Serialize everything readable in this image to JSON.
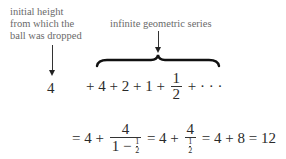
{
  "annotations": {
    "initial_height_label": [
      "initial height",
      "from which the",
      "ball was dropped"
    ],
    "series_label": "infinite geometric series"
  },
  "row1": {
    "first_term": "4",
    "series_terms": "+ 4 + 2 + 1 +",
    "fraction": {
      "numerator": "1",
      "denominator": "2"
    },
    "tail": "+ · · ·"
  },
  "row2": {
    "part1": "= 4 +",
    "frac1": {
      "numerator": "4",
      "denominator_prefix": "1 −",
      "denominator_frac": {
        "numerator": "1",
        "denominator": "2"
      }
    },
    "part2": "= 4 +",
    "frac2": {
      "numerator": "4",
      "denominator_frac": {
        "numerator": "1",
        "denominator": "2"
      }
    },
    "part3": "= 4 + 8 = 12"
  },
  "colors": {
    "label_text": "#6a6a6a",
    "math_text": "#2a2a2a",
    "lines": "#222222"
  }
}
